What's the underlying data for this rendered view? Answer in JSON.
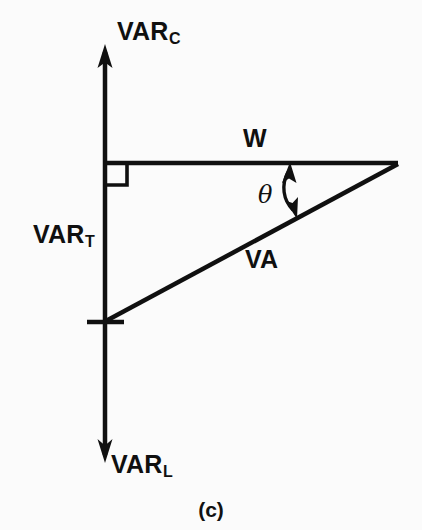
{
  "figure": {
    "caption": "(c)",
    "type": "vector-phasor-diagram",
    "background_color": "#fbfbfb",
    "stroke_color": "#101010"
  },
  "labels": {
    "var_c": {
      "base": "VAR",
      "sub": "C"
    },
    "var_t": {
      "base": "VAR",
      "sub": "T"
    },
    "var_l": {
      "base": "VAR",
      "sub": "L"
    },
    "w": "W",
    "va": "VA",
    "theta": "θ"
  },
  "geometry": {
    "origin": {
      "x": 105,
      "y": 163
    },
    "axis_top_tip": {
      "x": 105,
      "y": 45
    },
    "axis_bottom_tip": {
      "x": 105,
      "y": 462
    },
    "horizontal_end": {
      "x": 397,
      "y": 163
    },
    "va_start": {
      "x": 105,
      "y": 322
    },
    "va_end": {
      "x": 397,
      "y": 163
    },
    "tick_y": 322,
    "tick_x_from": 88,
    "tick_x_to": 124,
    "right_angle_size": 22
  }
}
